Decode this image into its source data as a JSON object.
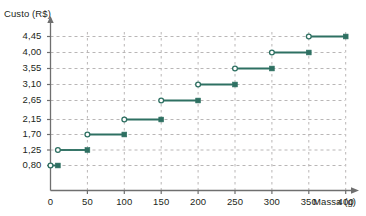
{
  "chart_data": {
    "type": "line",
    "title": "",
    "subtitle": "",
    "xlabel": "Massa (g)",
    "ylabel": "Custo (R$)",
    "xlim": [
      0,
      420
    ],
    "ylim": [
      0,
      4.9
    ],
    "grid": true,
    "grid_style": "dashed",
    "legend": "none",
    "step_style": "right-open-left-closed",
    "series_color": "#2e7062",
    "grid_color": "#b9b6b6",
    "axis_color": "#6f6f6f",
    "text_color": "#231f20",
    "xticks": [
      0,
      50,
      100,
      150,
      200,
      250,
      300,
      350,
      400
    ],
    "xtick_labels": [
      "0",
      "50",
      "100",
      "150",
      "200",
      "250",
      "300",
      "350",
      "400"
    ],
    "yticks": [
      0.8,
      1.25,
      1.7,
      2.15,
      2.65,
      3.1,
      3.55,
      4.0,
      4.45
    ],
    "ytick_labels": [
      "0,80",
      "1,25",
      "1,70",
      "2,15",
      "2,65",
      "3,10",
      "3,55",
      "4,00",
      "4,45"
    ],
    "segments": [
      {
        "x_start": 0,
        "x_end": 10,
        "y": 0.8,
        "left_marker": "open",
        "right_marker": "filled",
        "label": "0,80"
      },
      {
        "x_start": 10,
        "x_end": 50,
        "y": 1.25,
        "left_marker": "open",
        "right_marker": "filled",
        "label": "1,25"
      },
      {
        "x_start": 50,
        "x_end": 100,
        "y": 1.7,
        "left_marker": "open",
        "right_marker": "filled",
        "label": "1,70"
      },
      {
        "x_start": 100,
        "x_end": 150,
        "y": 2.15,
        "left_marker": "open",
        "right_marker": "filled",
        "label": "2,15"
      },
      {
        "x_start": 150,
        "x_end": 200,
        "y": 2.65,
        "left_marker": "open",
        "right_marker": "filled",
        "label": "2,65"
      },
      {
        "x_start": 200,
        "x_end": 250,
        "y": 3.1,
        "left_marker": "open",
        "right_marker": "filled",
        "label": "3,10"
      },
      {
        "x_start": 250,
        "x_end": 300,
        "y": 3.55,
        "left_marker": "open",
        "right_marker": "filled",
        "label": "3,55"
      },
      {
        "x_start": 300,
        "x_end": 350,
        "y": 4.0,
        "left_marker": "open",
        "right_marker": "filled",
        "label": "4,00"
      },
      {
        "x_start": 350,
        "x_end": 400,
        "y": 4.45,
        "left_marker": "open",
        "right_marker": "filled",
        "label": "4,45"
      }
    ]
  }
}
